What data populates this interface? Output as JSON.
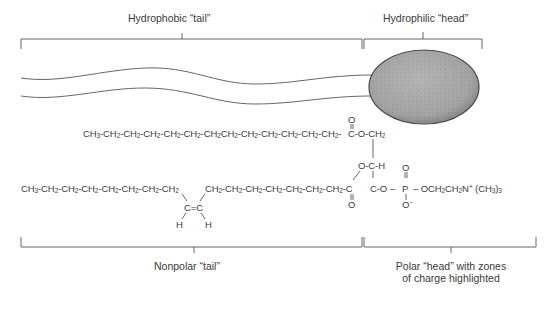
{
  "diagram": {
    "top_labels": {
      "tail": "Hydrophobic “tail”",
      "head": "Hydrophilic “head”"
    },
    "bottom_labels": {
      "tail": "Nonpolar “tail”",
      "head_line1": "Polar “head” with zones",
      "head_line2": "of charge highlighted"
    },
    "formula": {
      "chain1": [
        "CH",
        "3",
        "-CH",
        "2",
        "-CH",
        "2",
        "-CH",
        "2",
        "-CH",
        "2",
        "-CH",
        "2",
        "-CH",
        "2",
        "CH",
        "2",
        "-CH",
        "2",
        "-CH",
        "2",
        "-CH",
        "2",
        "-CH",
        "2",
        "-CH",
        "2",
        "-"
      ],
      "chain1_text": "CH3-CH2-CH2-CH2-CH2-CH2-CH2-CH2-CH2-CH2-CH2-CH2-CH2-",
      "ester1": "C-O-CH",
      "ester1_sub": "2",
      "ester1_carbonyl_o": "O",
      "glycerol_middle": "O-C-H",
      "chain2a_text": "CH3-CH2-CH2-CH2-CH2-CH2-CH2-CH2",
      "double_bond": "C=C",
      "h_left": "H",
      "h_right": "H",
      "chain2b_text": "CH2-CH2-CH2-CH2-CH2-CH2-CH2-C",
      "ester2_carbonyl_o": "O",
      "glycerol_bottom": "C-O",
      "phosphate_p": "P",
      "phosphate_o_top": "O",
      "phosphate_o_minus": "O",
      "phosphate_charge": "−",
      "choline": "OCH2CH2N+(CH3)3"
    },
    "colors": {
      "line": "#555555",
      "head_fill": "#a9a9a9",
      "head_stroke": "#4a4a4a",
      "text": "#3a3a3a"
    }
  }
}
